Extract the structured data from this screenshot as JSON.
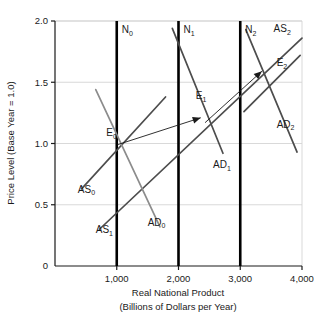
{
  "chart_data": {
    "type": "line",
    "title": "",
    "xlabel": "Real National Product (Billions of Dollars per Year)",
    "xlabel_line1": "Real National Product",
    "xlabel_line2": "(Billions of Dollars per Year)",
    "ylabel": "Price Level (Base Year = 1.0)",
    "xlim": [
      0,
      4000
    ],
    "ylim": [
      0,
      2.0
    ],
    "grid": true,
    "legend_position": "inline-labels",
    "x_ticks": [
      "0",
      "1,000",
      "2,000",
      "3,000",
      "4,000"
    ],
    "x_tick_values": [
      0,
      1000,
      2000,
      3000,
      4000
    ],
    "y_ticks": [
      "0",
      "0.5",
      "1.0",
      "1.5",
      "2.0"
    ],
    "y_tick_values": [
      0,
      0.5,
      1.0,
      1.5,
      2.0
    ],
    "series": [
      {
        "name": "N0",
        "label": "N",
        "sub": "0",
        "type": "vertical-line",
        "color": "#000000",
        "width": 2.6,
        "x": 1000,
        "y_from": 0,
        "y_to": 2.0,
        "label_x": 1080,
        "label_y": 1.9
      },
      {
        "name": "N1",
        "label": "N",
        "sub": "1",
        "type": "vertical-line",
        "color": "#000000",
        "width": 2.6,
        "x": 2000,
        "y_from": 0,
        "y_to": 2.0,
        "label_x": 2080,
        "label_y": 1.9
      },
      {
        "name": "N2",
        "label": "N",
        "sub": "2",
        "type": "vertical-line",
        "color": "#000000",
        "width": 2.6,
        "x": 3000,
        "y_from": 0,
        "y_to": 2.0,
        "label_x": 3080,
        "label_y": 1.9
      },
      {
        "name": "AS0",
        "label": "AS",
        "sub": "0",
        "type": "segment",
        "color": "#4d4d4d",
        "width": 1.7,
        "x": [
          430,
          1790
        ],
        "y": [
          0.63,
          1.38
        ],
        "label_x": 370,
        "label_y": 0.6
      },
      {
        "name": "AS1",
        "label": "AS",
        "sub": "1",
        "type": "segment",
        "color": "#4d4d4d",
        "width": 1.7,
        "x": [
          720,
          4000
        ],
        "y": [
          0.3,
          1.86
        ],
        "label_x": 660,
        "label_y": 0.27
      },
      {
        "name": "AS2",
        "label": "AS",
        "sub": "2",
        "type": "segment",
        "color": "#4d4d4d",
        "width": 1.7,
        "x": [
          3060,
          3970
        ],
        "y": [
          1.26,
          1.72
        ],
        "label_x": 3540,
        "label_y": 1.91
      },
      {
        "name": "AD0",
        "label": "AD",
        "sub": "0",
        "type": "segment",
        "color": "#8c8c8c",
        "width": 1.7,
        "x": [
          660,
          1700
        ],
        "y": [
          1.44,
          0.32
        ],
        "label_x": 1500,
        "label_y": 0.33
      },
      {
        "name": "AD1",
        "label": "AD",
        "sub": "1",
        "type": "segment",
        "color": "#4d4d4d",
        "width": 1.7,
        "x": [
          1900,
          2720
        ],
        "y": [
          1.94,
          0.92
        ],
        "label_x": 2560,
        "label_y": 0.8
      },
      {
        "name": "AD2",
        "label": "AD",
        "sub": "2",
        "type": "segment",
        "color": "#4d4d4d",
        "width": 1.7,
        "x": [
          3090,
          3920
        ],
        "y": [
          1.93,
          0.93
        ],
        "label_x": 3590,
        "label_y": 1.13
      },
      {
        "name": "E0",
        "type": "equilibrium-point",
        "label": "E",
        "sub": "0",
        "x": 1000,
        "y": 1.0,
        "label_x": 830,
        "label_y": 1.06
      },
      {
        "name": "E1",
        "type": "equilibrium-point",
        "label": "E",
        "sub": "1",
        "x": 2400,
        "y": 1.23,
        "label_x": 2280,
        "label_y": 1.36
      },
      {
        "name": "E2",
        "type": "equilibrium-point",
        "label": "E",
        "sub": "2",
        "x": 3490,
        "y": 1.57,
        "label_x": 3590,
        "label_y": 1.63
      }
    ],
    "arrows": [
      {
        "name": "shift-arrow-0-to-1",
        "color": "#1a1a1a",
        "from_x": 1010,
        "from_y": 0.99,
        "to_x": 2360,
        "to_y": 1.21
      },
      {
        "name": "shift-arrow-1-to-2",
        "color": "#1a1a1a",
        "from_x": 2430,
        "from_y": 1.17,
        "to_x": 3350,
        "to_y": 1.59
      }
    ],
    "annotations": []
  }
}
